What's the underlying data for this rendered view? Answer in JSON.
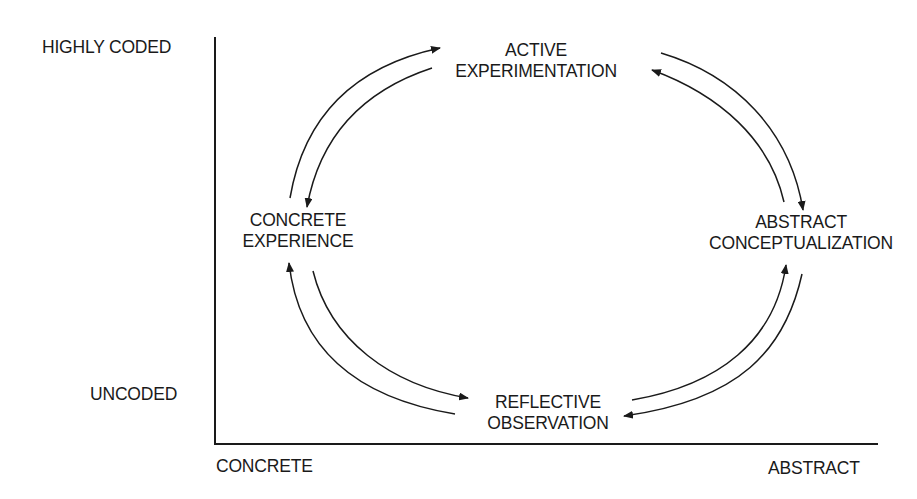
{
  "y_axis": {
    "top_label": "HIGHLY CODED",
    "bottom_label": "UNCODED"
  },
  "x_axis": {
    "left_label": "CONCRETE",
    "right_label": "ABSTRACT"
  },
  "stages": {
    "active_experimentation": {
      "line1": "ACTIVE",
      "line2": "EXPERIMENTATION"
    },
    "concrete_experience": {
      "line1": "CONCRETE",
      "line2": "EXPERIENCE"
    },
    "abstract_conceptualization": {
      "line1": "ABSTRACT",
      "line2": "CONCEPTUALIZATION"
    },
    "reflective_observation": {
      "line1": "REFLECTIVE",
      "line2": "OBSERVATION"
    }
  },
  "colors": {
    "ink": "#1a1a1a",
    "background": "#ffffff"
  }
}
